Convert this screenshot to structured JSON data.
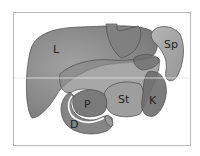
{
  "figure": {
    "type": "anatomical-diagram",
    "labels": {
      "liver": "L",
      "spleen": "Sp",
      "pancreas": "P",
      "stomach": "St",
      "kidney": "K",
      "duodenum": "D"
    },
    "colors": {
      "liver": "#8c8c8c",
      "spleen": "#a6a6a6",
      "stomach": "#9a9a9a",
      "pancreas": "#7d7d7d",
      "kidney": "#6e6e6e",
      "duodenum": "#858585",
      "outline": "#4a4a4a",
      "frame": "#b8b8b8",
      "guide_line": "#e6e6e6"
    }
  }
}
